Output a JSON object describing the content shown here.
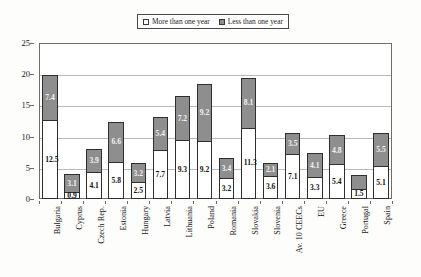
{
  "legend": {
    "entries": [
      {
        "label": "More than one year",
        "swatch": "white-square-icon",
        "color": "#ffffff"
      },
      {
        "label": "Less than one year",
        "swatch": "gray-square-icon",
        "color": "#8e8e8e"
      }
    ]
  },
  "axes": {
    "y_ticks": [
      "0",
      "5",
      "10",
      "15",
      "20",
      "25"
    ]
  },
  "chart_data": {
    "type": "bar",
    "title": "",
    "subtype": "stacked-vertical",
    "xlabel": "",
    "ylabel": "",
    "ylim": [
      0,
      25
    ],
    "ytick_step": 5,
    "grid": true,
    "legend_position": "top-center",
    "categories": [
      "Bulgaria",
      "Cyprus",
      "Czech Rep.",
      "Estonia",
      "Hungary",
      "Latvia",
      "Lithuania",
      "Poland",
      "Romania",
      "Slovakia",
      "Slovenia",
      "Av. 10 CEECs",
      "EU",
      "Greece",
      "Portugal",
      "Spain"
    ],
    "series": [
      {
        "name": "More than one year",
        "color": "#ffffff",
        "values": [
          12.5,
          0.9,
          4.1,
          5.8,
          2.5,
          7.7,
          9.3,
          9.2,
          3.2,
          11.3,
          3.6,
          7.1,
          3.3,
          5.4,
          1.5,
          5.1
        ],
        "labels": [
          "12.5",
          "0.9",
          "4.1",
          "5.8",
          "2.5",
          "7.7",
          "9.3",
          "9.2",
          "3.2",
          "11.3",
          "3.6",
          "7.1",
          "3.3",
          "5.4",
          "1.5",
          "5.1"
        ]
      },
      {
        "name": "Less than one year",
        "color": "#8e8e8e",
        "values": [
          7.4,
          3.1,
          3.9,
          6.6,
          3.2,
          5.4,
          7.2,
          9.2,
          3.4,
          8.1,
          2.1,
          3.5,
          4.1,
          4.8,
          2.4,
          5.5
        ],
        "labels": [
          "7.4",
          "3.1",
          "3.9",
          "6.6",
          "3.2",
          "5.4",
          "7.2",
          "9.2",
          "3.4",
          "8.1",
          "2.1",
          "3.5",
          "4.1",
          "4.8",
          "",
          "5.5"
        ]
      }
    ],
    "totals": [
      19.9,
      4.0,
      8.0,
      12.4,
      5.7,
      13.1,
      16.5,
      18.4,
      6.6,
      19.4,
      5.7,
      10.6,
      7.4,
      10.2,
      3.9,
      10.6
    ]
  }
}
